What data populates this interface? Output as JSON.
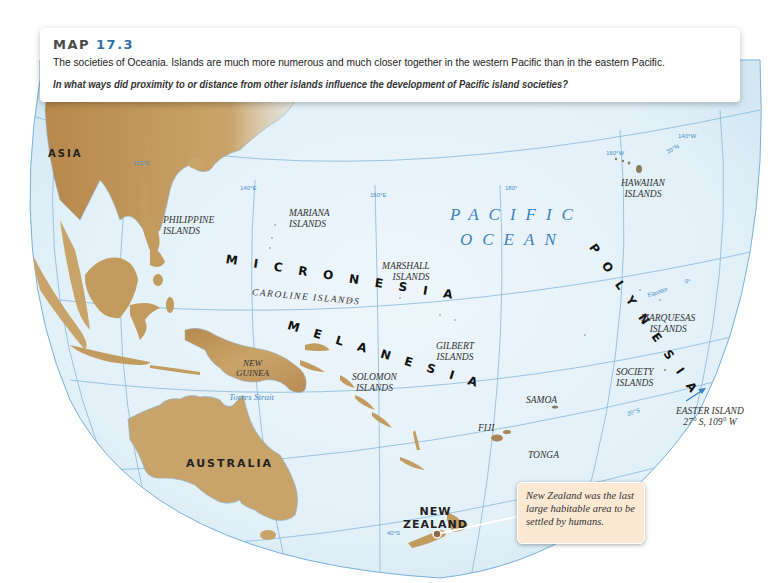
{
  "caption": {
    "map_label": "MAP",
    "map_number": "17.3",
    "description": "The societies of Oceania. Islands are much more numerous and much closer together in the western Pacific than in the eastern Pacific.",
    "question": "In what ways did proximity to or distance from other islands influence the development of Pacific island societies?"
  },
  "colors": {
    "ocean": "#e4f1f8",
    "land": "#c9a46a",
    "land_dark": "#9c7440",
    "gridline": "#7ab1d8",
    "accent_blue": "#2f6fa8",
    "callout_bg": "#fbe9d3"
  },
  "labels": {
    "asia": "ASIA",
    "australia": "AUSTRALIA",
    "new_zealand_1": "NEW",
    "new_zealand_2": "ZEALAND",
    "pacific": "PACIFIC",
    "ocean": "OCEAN",
    "micronesia": "MICRONESIA",
    "melanesia": "MELANESIA",
    "polynesia": "POLYNESIA",
    "philippine_1": "PHILIPPINE",
    "philippine_2": "ISLANDS",
    "mariana_1": "MARIANA",
    "mariana_2": "ISLANDS",
    "marshall_1": "MARSHALL",
    "marshall_2": "ISLANDS",
    "caroline": "CAROLINE ISLANDS",
    "gilbert_1": "GILBERT",
    "gilbert_2": "ISLANDS",
    "solomon_1": "SOLOMON",
    "solomon_2": "ISLANDS",
    "new_guinea_1": "NEW",
    "new_guinea_2": "GUINEA",
    "torres": "Torres Strait",
    "hawaiian_1": "HAWAIIAN",
    "hawaiian_2": "ISLANDS",
    "marquesas_1": "MARQUESAS",
    "marquesas_2": "ISLANDS",
    "society_1": "SOCIETY",
    "society_2": "ISLANDS",
    "samoa": "SAMOA",
    "fiji": "FIJI",
    "tonga": "TONGA",
    "easter_1": "EASTER ISLAND",
    "easter_2": "27° S, 109° W"
  },
  "grid_labels": {
    "lon_120e": "120°E",
    "lon_140e": "140°E",
    "lon_160e": "160°E",
    "lon_180": "180°",
    "lon_160w": "160°W",
    "lon_140w": "140°W",
    "lat_20n": "20°N",
    "lat_equator": "Equator",
    "lat_0": "0°",
    "lat_20s": "20°S",
    "lat_40s": "40°S"
  },
  "callout": {
    "text": "New Zealand was the last large habitable area to be settled by humans."
  }
}
